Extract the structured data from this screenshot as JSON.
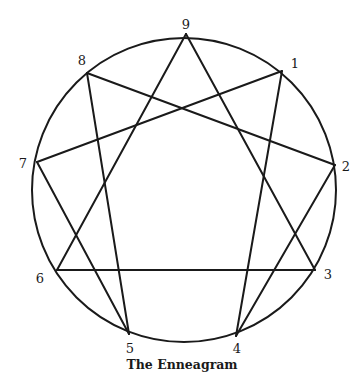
{
  "figure": {
    "caption": "The Enneagram",
    "stroke_color": "#1a1a1a",
    "circle": {
      "cx": 184,
      "cy": 190,
      "r": 152
    },
    "points": [
      {
        "id": "9",
        "label": "9",
        "x": 186,
        "y": 34,
        "lx": 186,
        "ly": 24
      },
      {
        "id": "1",
        "label": "1",
        "x": 282,
        "y": 71,
        "lx": 295,
        "ly": 63
      },
      {
        "id": "2",
        "label": "2",
        "x": 335,
        "y": 165,
        "lx": 346,
        "ly": 166
      },
      {
        "id": "3",
        "label": "3",
        "x": 315,
        "y": 270,
        "lx": 328,
        "ly": 274
      },
      {
        "id": "4",
        "label": "4",
        "x": 236,
        "y": 336,
        "lx": 237,
        "ly": 348
      },
      {
        "id": "5",
        "label": "5",
        "x": 129,
        "y": 334,
        "lx": 130,
        "ly": 348
      },
      {
        "id": "6",
        "label": "6",
        "x": 57,
        "y": 270,
        "lx": 40,
        "ly": 278
      },
      {
        "id": "7",
        "label": "7",
        "x": 37,
        "y": 162,
        "lx": 23,
        "ly": 163
      },
      {
        "id": "8",
        "label": "8",
        "x": 87,
        "y": 73,
        "lx": 82,
        "ly": 60
      }
    ],
    "triangle_edges": [
      [
        "9",
        "3"
      ],
      [
        "3",
        "6"
      ],
      [
        "6",
        "9"
      ]
    ],
    "hexad_edges": [
      [
        "1",
        "4"
      ],
      [
        "4",
        "2"
      ],
      [
        "2",
        "8"
      ],
      [
        "8",
        "5"
      ],
      [
        "5",
        "7"
      ],
      [
        "7",
        "1"
      ]
    ]
  }
}
